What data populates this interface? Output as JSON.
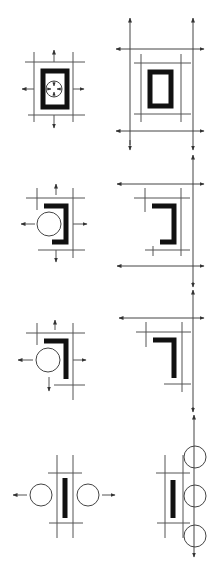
{
  "diagram": {
    "title": "",
    "colors": {
      "background": "#ffffff",
      "thin_line": "#555555",
      "thick_shape": "#111111",
      "circle_stroke": "#444444",
      "arrow": "#333333"
    },
    "rows": [
      {
        "id": "row-1",
        "left": {
          "shape": "closed-rectangle",
          "circles": 1,
          "circle_note": "small circle with four inward arrows inside the rectangle",
          "arrows": [
            "up",
            "down",
            "left",
            "right"
          ]
        },
        "right": {
          "shape": "closed-rectangle",
          "circles": 0,
          "guide_arrows": [
            "horizontal-top",
            "horizontal-bottom",
            "vertical-left",
            "vertical-right"
          ]
        }
      },
      {
        "id": "row-2",
        "left": {
          "shape": "bracket-right",
          "circles": 1,
          "arrows": [
            "up",
            "down",
            "left",
            "right"
          ]
        },
        "right": {
          "shape": "bracket-right",
          "circles": 0,
          "guide_arrows": [
            "horizontal-top",
            "horizontal-bottom",
            "vertical-right"
          ]
        }
      },
      {
        "id": "row-3",
        "left": {
          "shape": "corner-L",
          "circles": 1,
          "arrows": [
            "up",
            "down",
            "left",
            "right"
          ]
        },
        "right": {
          "shape": "corner-L",
          "circles": 0,
          "guide_arrows": [
            "horizontal-top",
            "vertical-right"
          ]
        }
      },
      {
        "id": "row-4",
        "left": {
          "shape": "vertical-bar",
          "circles": 2,
          "arrows": [
            "left",
            "right"
          ]
        },
        "right": {
          "shape": "vertical-bar",
          "circles": 3,
          "guide_arrows": [
            "vertical-right"
          ]
        }
      }
    ]
  }
}
